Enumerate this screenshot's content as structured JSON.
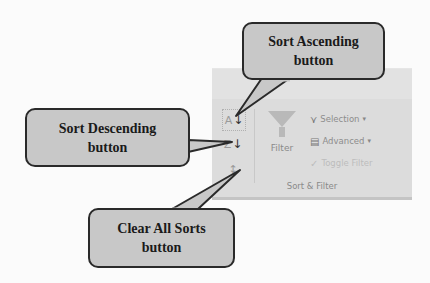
{
  "ribbon": {
    "group_label": "Sort & Filter",
    "sort_ascending": {
      "glyph": "A↓Z",
      "icon": "sort-ascending-icon"
    },
    "sort_descending": {
      "glyph": "Z↓A",
      "icon": "sort-descending-icon"
    },
    "clear_all_sorts": {
      "glyph": "↕",
      "icon": "clear-sorts-icon"
    },
    "filter": {
      "label": "Filter",
      "icon": "funnel-icon"
    },
    "commands": [
      {
        "label": "Selection",
        "icon": "selection-filter-icon",
        "glyph": "⋎",
        "dropdown": "▾",
        "enabled": true
      },
      {
        "label": "Advanced",
        "icon": "advanced-filter-icon",
        "glyph": "▤",
        "dropdown": "▾",
        "enabled": true
      },
      {
        "label": "Toggle Filter",
        "icon": "toggle-filter-icon",
        "glyph": "✓",
        "dropdown": "",
        "enabled": false
      }
    ]
  },
  "callouts": {
    "sort_ascending": {
      "line1": "Sort Ascending",
      "line2": "button"
    },
    "sort_descending": {
      "line1": "Sort Descending",
      "line2": "button"
    },
    "clear_all_sorts": {
      "line1": "Clear All Sorts",
      "line2": "button"
    }
  },
  "colors": {
    "ribbon_bg": "#dcdcdc",
    "callout_bg": "#c8c8c8",
    "callout_border": "#2a2a2a"
  }
}
